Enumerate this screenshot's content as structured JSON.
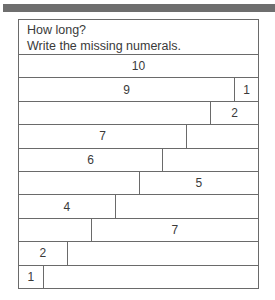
{
  "worksheet": {
    "title": "How long?",
    "instruction": "Write the missing numerals.",
    "total_units": 10,
    "rows": [
      {
        "left": {
          "units": 10,
          "label": "10"
        },
        "right": null
      },
      {
        "left": {
          "units": 9,
          "label": "9"
        },
        "right": {
          "units": 1,
          "label": "1"
        }
      },
      {
        "left": {
          "units": 8,
          "label": ""
        },
        "right": {
          "units": 2,
          "label": "2"
        }
      },
      {
        "left": {
          "units": 7,
          "label": "7"
        },
        "right": {
          "units": 3,
          "label": ""
        }
      },
      {
        "left": {
          "units": 6,
          "label": "6"
        },
        "right": {
          "units": 4,
          "label": ""
        }
      },
      {
        "left": {
          "units": 5,
          "label": ""
        },
        "right": {
          "units": 5,
          "label": "5"
        }
      },
      {
        "left": {
          "units": 4,
          "label": "4"
        },
        "right": {
          "units": 6,
          "label": ""
        }
      },
      {
        "left": {
          "units": 3,
          "label": ""
        },
        "right": {
          "units": 7,
          "label": "7"
        }
      },
      {
        "left": {
          "units": 2,
          "label": "2"
        },
        "right": {
          "units": 8,
          "label": ""
        }
      },
      {
        "left": {
          "units": 1,
          "label": "1"
        },
        "right": {
          "units": 9,
          "label": ""
        }
      }
    ]
  }
}
